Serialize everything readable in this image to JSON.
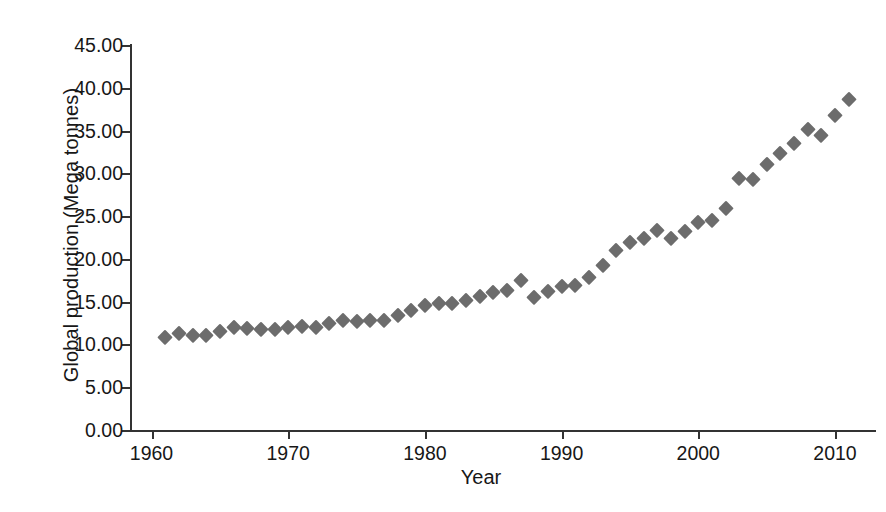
{
  "chart_data": {
    "type": "scatter",
    "title": "",
    "xlabel": "Year",
    "ylabel": "Global production (Mega tonnes)",
    "xlim": [
      1958.5,
      2013.0
    ],
    "ylim": [
      0.0,
      45.0
    ],
    "grid": false,
    "legend": null,
    "marker": "diamond",
    "marker_color": "#6c6c6c",
    "axis_color": "#333333",
    "xticks": [
      1960,
      1970,
      1980,
      1990,
      2000,
      2010
    ],
    "xticklabels": [
      "1960",
      "1970",
      "1980",
      "1990",
      "2000",
      "2010"
    ],
    "yticks": [
      0,
      5,
      10,
      15,
      20,
      25,
      30,
      35,
      40,
      45
    ],
    "yticklabels": [
      "0.00",
      "5.00",
      "10.00",
      "15.00",
      "20.00",
      "25.00",
      "30.00",
      "35.00",
      "40.00",
      "45.00"
    ],
    "x": [
      1961,
      1962,
      1963,
      1964,
      1965,
      1966,
      1967,
      1968,
      1969,
      1970,
      1971,
      1972,
      1973,
      1974,
      1975,
      1976,
      1977,
      1978,
      1979,
      1980,
      1981,
      1982,
      1983,
      1984,
      1985,
      1986,
      1987,
      1988,
      1989,
      1990,
      1991,
      1992,
      1993,
      1994,
      1995,
      1996,
      1997,
      1998,
      1999,
      2000,
      2001,
      2002,
      2003,
      2004,
      2005,
      2006,
      2007,
      2008,
      2009,
      2010,
      2011
    ],
    "y": [
      10.9,
      11.3,
      11.1,
      11.1,
      11.6,
      12.0,
      11.9,
      11.8,
      11.8,
      12.0,
      12.1,
      12.0,
      12.5,
      12.8,
      12.7,
      12.8,
      12.8,
      13.4,
      14.0,
      14.6,
      14.9,
      14.9,
      15.2,
      15.7,
      16.1,
      16.4,
      17.5,
      15.5,
      16.2,
      16.8,
      17.0,
      17.9,
      19.3,
      21.0,
      22.0,
      22.5,
      23.4,
      22.4,
      23.3,
      24.3,
      24.6,
      25.9,
      29.4,
      29.3,
      31.1,
      32.4,
      33.5,
      35.2,
      34.5,
      36.8,
      38.7
    ],
    "units": "Mega tonnes",
    "n_points": 51
  },
  "axis": {
    "x_title": "Year",
    "y_title": "Global production (Mega tonnes)"
  }
}
